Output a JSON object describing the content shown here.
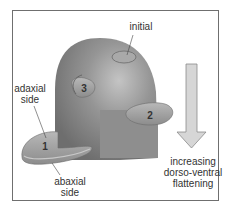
{
  "labels": {
    "initial": "initial",
    "adaxial": "adaxial\nside",
    "abaxial": "abaxial\nside",
    "arrow_caption": "increasing\ndorso-ventral\nflattening",
    "primordium_1": "1",
    "primordium_2": "2",
    "primordium_3": "3"
  },
  "colors": {
    "apex": "#8a8a8a",
    "apex_highlight": "#b4b4b4",
    "primordium": "#a6a6a6",
    "arrow_fill": "#d6d6d6",
    "arrow_stroke": "#8a8a8a",
    "frame": "#6f6f6f"
  }
}
